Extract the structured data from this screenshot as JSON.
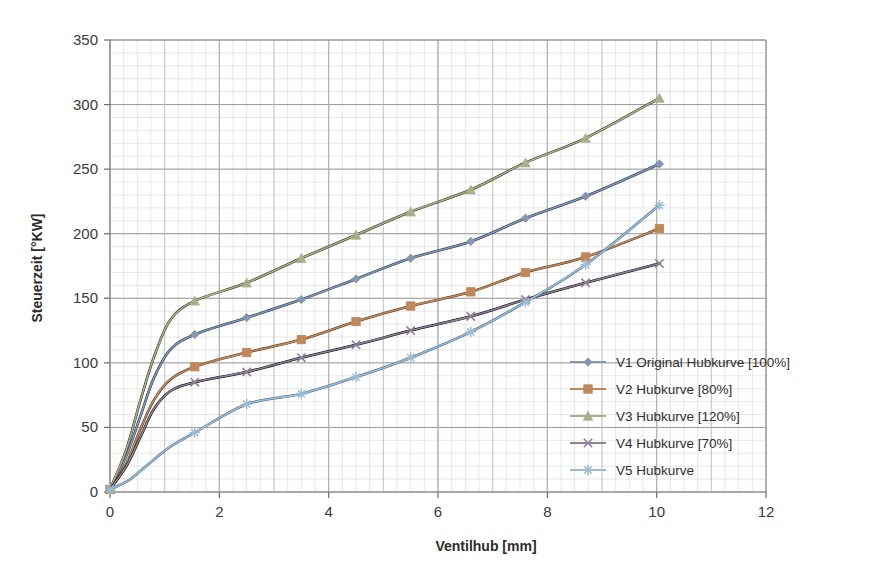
{
  "chart_data": {
    "type": "line",
    "title": "",
    "xlabel": "Ventilhub [mm]",
    "ylabel": "Steuerzeit [°KW]",
    "xlim": [
      0,
      12
    ],
    "ylim": [
      0,
      350
    ],
    "xticks": [
      0,
      2,
      4,
      6,
      8,
      10,
      12
    ],
    "xtick_labels": [
      "0",
      "2",
      "4",
      "6",
      "8",
      "10",
      "12"
    ],
    "yticks": [
      0,
      50,
      100,
      150,
      200,
      250,
      300,
      350
    ],
    "ytick_labels": [
      "0",
      "50",
      "100",
      "150",
      "200",
      "250",
      "300",
      "350"
    ],
    "grid": true,
    "minor_grid": true,
    "minor_x_step": 0.25,
    "minor_y_step": 10,
    "legend_position": "right-inside",
    "series": [
      {
        "name": "V1 Original Hubkurve [100%]",
        "color": "#8496b0",
        "line_color": "#23344a",
        "marker": "diamond",
        "x": [
          0.0,
          0.3,
          0.55,
          0.8,
          1.1,
          1.55,
          2.5,
          3.5,
          4.5,
          5.5,
          6.6,
          7.6,
          8.7,
          10.05
        ],
        "y": [
          2,
          28,
          58,
          88,
          110,
          122,
          135,
          149,
          165,
          181,
          194,
          212,
          229,
          254
        ]
      },
      {
        "name": "V2 Hubkurve [80%]",
        "color": "#c0875a",
        "line_color": "#5a3a20",
        "marker": "square",
        "x": [
          0.0,
          0.3,
          0.55,
          0.8,
          1.1,
          1.55,
          2.5,
          3.5,
          4.5,
          5.5,
          6.6,
          7.6,
          8.7,
          10.05
        ],
        "y": [
          2,
          22,
          48,
          71,
          87,
          97,
          108,
          118,
          132,
          144,
          155,
          170,
          182,
          204
        ]
      },
      {
        "name": "V3 Hubkurve [120%]",
        "color": "#a9b089",
        "line_color": "#2f3320",
        "marker": "triangle",
        "x": [
          0.0,
          0.3,
          0.55,
          0.8,
          1.1,
          1.55,
          2.5,
          3.5,
          4.5,
          5.5,
          6.6,
          7.6,
          8.7,
          10.05
        ],
        "y": [
          2,
          33,
          70,
          104,
          133,
          148,
          162,
          181,
          199,
          217,
          234,
          255,
          274,
          305
        ]
      },
      {
        "name": "V4 Hubkurve [70%]",
        "color": "#8c8296",
        "line_color": "#000000",
        "marker": "cross",
        "x": [
          0.0,
          0.3,
          0.55,
          0.8,
          1.1,
          1.55,
          2.5,
          3.5,
          4.5,
          5.5,
          6.6,
          7.6,
          8.7,
          10.05
        ],
        "y": [
          2,
          20,
          42,
          64,
          78,
          85,
          93,
          104,
          114,
          125,
          136,
          149,
          162,
          177
        ]
      },
      {
        "name": "V5 Hubkurve",
        "color": "#9dbcd4",
        "line_color": "#4a6a86",
        "marker": "asterisk",
        "x": [
          0.0,
          0.3,
          0.55,
          0.8,
          1.1,
          1.55,
          2.5,
          3.5,
          4.5,
          5.5,
          6.6,
          7.6,
          8.7,
          10.05
        ],
        "y": [
          2,
          8,
          16,
          25,
          35,
          46,
          68,
          76,
          89,
          104,
          124,
          147,
          176,
          222
        ]
      }
    ]
  },
  "legend": {
    "items": [
      {
        "label": "V1 Original Hubkurve [100%]"
      },
      {
        "label": "V2 Hubkurve [80%]"
      },
      {
        "label": "V3 Hubkurve [120%]"
      },
      {
        "label": "V4 Hubkurve [70%]"
      },
      {
        "label": "V5 Hubkurve"
      }
    ]
  }
}
